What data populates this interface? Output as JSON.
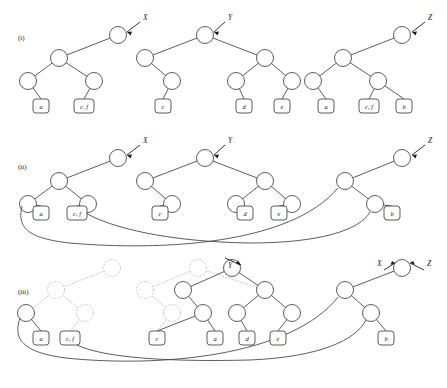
{
  "figure": {
    "width": 447,
    "height": 388,
    "background": "#ffffff",
    "ink_color": "#4a4a4a",
    "ghost_color": "#b4b4b4",
    "text_color": "#1a1a1a"
  },
  "rows": [
    {
      "id": "i",
      "label": "(i)",
      "label_x": 18,
      "label_y": 40
    },
    {
      "id": "ii",
      "label": "(ii)",
      "label_x": 18,
      "label_y": 169
    },
    {
      "id": "iii",
      "label": "(iii)",
      "label_x": 18,
      "label_y": 294
    }
  ],
  "pointers": {
    "row_i": [
      {
        "name": "X",
        "x": 143,
        "y": 20
      },
      {
        "name": "Y",
        "x": 228,
        "y": 20
      },
      {
        "name": "Z",
        "x": 428,
        "y": 20
      }
    ],
    "row_ii": [
      {
        "name": "X",
        "x": 143,
        "y": 143
      },
      {
        "name": "Y",
        "x": 228,
        "y": 143
      },
      {
        "name": "Z",
        "x": 428,
        "y": 143
      }
    ],
    "row_iii": [
      {
        "name": "Y",
        "x": 228,
        "y": 268
      },
      {
        "name": "X",
        "x": 381,
        "y": 265
      },
      {
        "name": "Z",
        "x": 432,
        "y": 265
      }
    ]
  },
  "leaves": {
    "row_i": [
      {
        "label": "a",
        "x": 41,
        "y": 106
      },
      {
        "label": "c, f",
        "x": 84,
        "y": 106
      },
      {
        "label": "c",
        "x": 163,
        "y": 106
      },
      {
        "label": "d",
        "x": 244,
        "y": 106
      },
      {
        "label": "e",
        "x": 282,
        "y": 106
      },
      {
        "label": "a",
        "x": 326,
        "y": 106
      },
      {
        "label": "c, f",
        "x": 369,
        "y": 106
      },
      {
        "label": "b",
        "x": 404,
        "y": 106
      }
    ],
    "row_ii": [
      {
        "label": "a",
        "x": 41,
        "y": 213
      },
      {
        "label": "c, f",
        "x": 77,
        "y": 213
      },
      {
        "label": "c",
        "x": 160,
        "y": 213
      },
      {
        "label": "d",
        "x": 245,
        "y": 213
      },
      {
        "label": "e",
        "x": 279,
        "y": 213
      },
      {
        "label": "b",
        "x": 392,
        "y": 213
      }
    ],
    "row_iii": [
      {
        "label": "a",
        "x": 41,
        "y": 338
      },
      {
        "label": "c, f",
        "x": 70,
        "y": 338
      },
      {
        "label": "c",
        "x": 157,
        "y": 338
      },
      {
        "label": "a",
        "x": 215,
        "y": 338
      },
      {
        "label": "d",
        "x": 247,
        "y": 338
      },
      {
        "label": "e",
        "x": 278,
        "y": 338
      },
      {
        "label": "b",
        "x": 386,
        "y": 338
      }
    ]
  },
  "nodes": {
    "row_i": [
      {
        "x": 118,
        "y": 35,
        "ghost": false,
        "role": "root-x"
      },
      {
        "x": 59,
        "y": 58,
        "ghost": false,
        "role": "internal"
      },
      {
        "x": 28,
        "y": 81,
        "ghost": false,
        "role": "internal"
      },
      {
        "x": 94,
        "y": 81,
        "ghost": false,
        "role": "internal"
      },
      {
        "x": 205,
        "y": 35,
        "ghost": false,
        "role": "root-y"
      },
      {
        "x": 145,
        "y": 58,
        "ghost": false,
        "role": "internal"
      },
      {
        "x": 172,
        "y": 81,
        "ghost": false,
        "role": "internal"
      },
      {
        "x": 265,
        "y": 58,
        "ghost": false,
        "role": "internal"
      },
      {
        "x": 236,
        "y": 81,
        "ghost": false,
        "role": "internal"
      },
      {
        "x": 292,
        "y": 81,
        "ghost": false,
        "role": "internal"
      },
      {
        "x": 402,
        "y": 35,
        "ghost": false,
        "role": "root-z"
      },
      {
        "x": 343,
        "y": 58,
        "ghost": false,
        "role": "internal"
      },
      {
        "x": 313,
        "y": 81,
        "ghost": false,
        "role": "internal"
      },
      {
        "x": 378,
        "y": 81,
        "ghost": false,
        "role": "internal"
      }
    ],
    "row_ii": [
      {
        "x": 118,
        "y": 158,
        "ghost": false,
        "role": "root-x"
      },
      {
        "x": 59,
        "y": 181,
        "ghost": false,
        "role": "internal"
      },
      {
        "x": 28,
        "y": 204,
        "ghost": false,
        "role": "internal"
      },
      {
        "x": 88,
        "y": 204,
        "ghost": false,
        "role": "internal"
      },
      {
        "x": 205,
        "y": 158,
        "ghost": false,
        "role": "root-y"
      },
      {
        "x": 145,
        "y": 181,
        "ghost": false,
        "role": "internal"
      },
      {
        "x": 172,
        "y": 204,
        "ghost": false,
        "role": "internal"
      },
      {
        "x": 265,
        "y": 181,
        "ghost": false,
        "role": "internal"
      },
      {
        "x": 236,
        "y": 204,
        "ghost": false,
        "role": "internal"
      },
      {
        "x": 292,
        "y": 204,
        "ghost": false,
        "role": "internal"
      },
      {
        "x": 402,
        "y": 158,
        "ghost": false,
        "role": "root-z"
      },
      {
        "x": 345,
        "y": 181,
        "ghost": false,
        "role": "internal"
      },
      {
        "x": 375,
        "y": 204,
        "ghost": false,
        "role": "internal"
      }
    ],
    "row_iii": [
      {
        "x": 112,
        "y": 268,
        "ghost": true,
        "role": "removed-root-x"
      },
      {
        "x": 56,
        "y": 290,
        "ghost": true,
        "role": "removed"
      },
      {
        "x": 85,
        "y": 313,
        "ghost": true,
        "role": "removed"
      },
      {
        "x": 26,
        "y": 313,
        "ghost": false,
        "role": "internal"
      },
      {
        "x": 198,
        "y": 268,
        "ghost": true,
        "role": "removed"
      },
      {
        "x": 145,
        "y": 290,
        "ghost": true,
        "role": "removed"
      },
      {
        "x": 172,
        "y": 313,
        "ghost": true,
        "role": "removed"
      },
      {
        "x": 232,
        "y": 268,
        "ghost": false,
        "role": "root-y"
      },
      {
        "x": 183,
        "y": 290,
        "ghost": false,
        "role": "internal"
      },
      {
        "x": 203,
        "y": 313,
        "ghost": false,
        "role": "internal"
      },
      {
        "x": 265,
        "y": 290,
        "ghost": false,
        "role": "internal"
      },
      {
        "x": 237,
        "y": 313,
        "ghost": false,
        "role": "internal"
      },
      {
        "x": 292,
        "y": 313,
        "ghost": false,
        "role": "internal"
      },
      {
        "x": 402,
        "y": 268,
        "ghost": false,
        "role": "root-xz"
      },
      {
        "x": 345,
        "y": 290,
        "ghost": false,
        "role": "internal"
      },
      {
        "x": 371,
        "y": 313,
        "ghost": false,
        "role": "internal"
      }
    ]
  },
  "caption_note": "Three-row tree transformation diagram showing pointers X, Y and Z over persistent binary trees with leaf sets a, b, c, d, e, f."
}
